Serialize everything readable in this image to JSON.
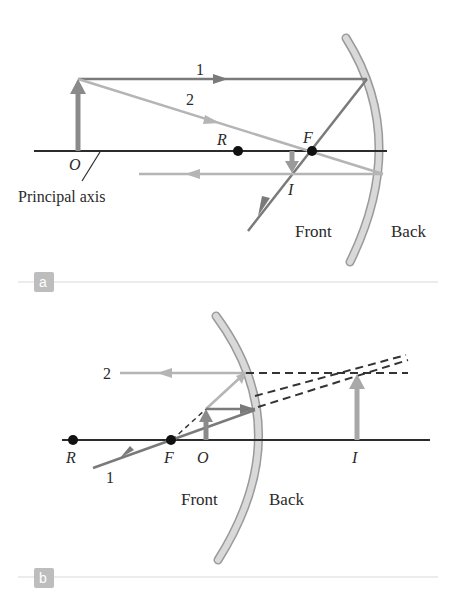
{
  "colors": {
    "axis": "#2b2b2b",
    "ray_dark": "#7a7a7a",
    "ray_light": "#b5b5b5",
    "mirror_fill": "#d4d4d4",
    "mirror_stroke": "#9a9a9a",
    "object_arrow": "#8a8a8a",
    "badge_bg": "#bdbdbd",
    "separator": "#d9d9d9"
  },
  "panel_a": {
    "badge": "a",
    "ray_1_label": "1",
    "ray_2_label": "2",
    "point_R": "R",
    "point_F": "F",
    "object_label": "O",
    "image_label": "I",
    "axis_label": "Principal axis",
    "front_label": "Front",
    "back_label": "Back"
  },
  "panel_b": {
    "badge": "b",
    "ray_1_label": "1",
    "ray_2_label": "2",
    "point_R": "R",
    "point_F": "F",
    "object_label": "O",
    "image_label": "I",
    "front_label": "Front",
    "back_label": "Back"
  }
}
